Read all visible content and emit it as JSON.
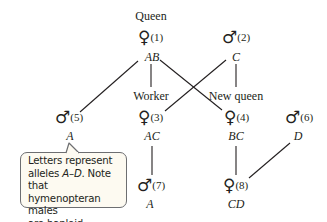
{
  "diagram": {
    "title_label": "Queen",
    "individuals": [
      {
        "id": 1,
        "sex": "female",
        "symbol": "♀",
        "number": "(1)",
        "genotype": "AB",
        "role": "Queen"
      },
      {
        "id": 2,
        "sex": "male",
        "symbol": "♂",
        "number": "(2)",
        "genotype": "C"
      },
      {
        "id": 3,
        "sex": "female",
        "symbol": "♀",
        "number": "(3)",
        "genotype": "AC",
        "role": "Worker"
      },
      {
        "id": 4,
        "sex": "female",
        "symbol": "♀",
        "number": "(4)",
        "genotype": "BC",
        "role": "New queen"
      },
      {
        "id": 5,
        "sex": "male",
        "symbol": "♂",
        "number": "(5)",
        "genotype": "A"
      },
      {
        "id": 6,
        "sex": "male",
        "symbol": "♂",
        "number": "(6)",
        "genotype": "D"
      },
      {
        "id": 7,
        "sex": "male",
        "symbol": "♂",
        "number": "(7)",
        "genotype": "A"
      },
      {
        "id": 8,
        "sex": "female",
        "symbol": "♀",
        "number": "(8)",
        "genotype": "CD"
      }
    ],
    "roles": {
      "queen": "Queen",
      "worker": "Worker",
      "new_queen": "New queen"
    },
    "edges": [
      {
        "from": 1,
        "to": 5
      },
      {
        "from": 1,
        "to": 3
      },
      {
        "from": 1,
        "to": 4
      },
      {
        "from": 2,
        "to": 3
      },
      {
        "from": 2,
        "to": 4
      },
      {
        "from": 3,
        "to": 7
      },
      {
        "from": 4,
        "to": 8
      },
      {
        "from": 6,
        "to": 8
      }
    ],
    "callout": {
      "line1": "Letters represent",
      "line2_pre": "alleles ",
      "line2_italic": "A–D",
      "line2_post": ". Note that",
      "line3": "hymenopteran males",
      "line4": "are haploid."
    },
    "colors": {
      "line": "#231f20",
      "callout_border": "#6d6e71",
      "callout_fill": "#fdfaf1"
    }
  }
}
